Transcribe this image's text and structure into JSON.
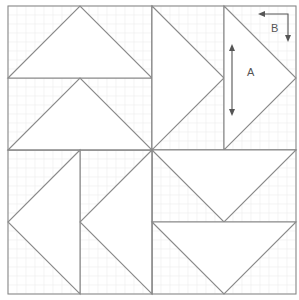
{
  "diagram": {
    "type": "quilt-block-pattern",
    "colors": {
      "background": "#ffffff",
      "grid": "#ececec",
      "lines": "#8a8a8a",
      "annotation": "#555555"
    },
    "outer_square": {
      "x1": 8,
      "y1": 6,
      "x2": 296,
      "y2": 294
    },
    "center": {
      "x": 152,
      "y": 150
    },
    "grid_spacing": 9,
    "quadrants": [
      {
        "name": "top-left",
        "orientation": "triangles-pointing-up",
        "divider": "horizontal"
      },
      {
        "name": "top-right",
        "orientation": "triangles-pointing-right",
        "divider": "vertical"
      },
      {
        "name": "bottom-left",
        "orientation": "triangles-pointing-left",
        "divider": "vertical"
      },
      {
        "name": "bottom-right",
        "orientation": "triangles-pointing-down",
        "divider": "horizontal"
      }
    ],
    "labels": {
      "a": "A",
      "b": "B"
    },
    "annotations": [
      {
        "label": "A",
        "type": "double-arrow-vertical",
        "description": "Length of flying-geese unit"
      },
      {
        "label": "B",
        "type": "corner-arrow",
        "description": "Width of flying-geese unit"
      }
    ]
  }
}
